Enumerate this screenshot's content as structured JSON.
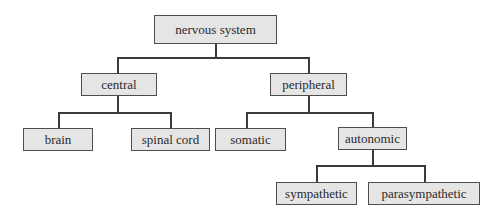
{
  "diagram": {
    "type": "tree",
    "root": {
      "label": "nervous system",
      "children": [
        {
          "label": "central",
          "children": [
            {
              "label": "brain"
            },
            {
              "label": "spinal cord"
            }
          ]
        },
        {
          "label": "peripheral",
          "children": [
            {
              "label": "somatic"
            },
            {
              "label": "autonomic",
              "children": [
                {
                  "label": "sympathetic"
                },
                {
                  "label": "parasympathetic"
                }
              ]
            }
          ]
        }
      ]
    },
    "nodes": {
      "nervous_system": "nervous system",
      "central": "central",
      "peripheral": "peripheral",
      "brain": "brain",
      "spinal_cord": "spinal cord",
      "somatic": "somatic",
      "autonomic": "autonomic",
      "sympathetic": "sympathetic",
      "parasympathetic": "parasympathetic"
    },
    "colors": {
      "box_fill": "#e5e5e5",
      "box_border": "#4d4d4d",
      "connector": "#3a3a3a",
      "text": "#2a2a2a"
    }
  }
}
